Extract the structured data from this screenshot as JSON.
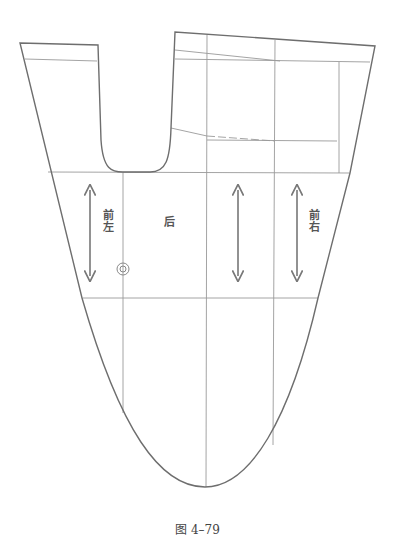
{
  "figure": {
    "caption": "图 4–79",
    "labels": {
      "front_left": "前左",
      "back": "后",
      "front_right": "前右"
    },
    "icons": [
      "grain-arrow-icon",
      "grain-arrow-icon",
      "grain-arrow-icon",
      "grain-arrow-icon",
      "button-mark-icon"
    ],
    "colors": {
      "outline": "#6e6e6e",
      "grid": "#9a9a9a",
      "background": "#ffffff"
    }
  }
}
